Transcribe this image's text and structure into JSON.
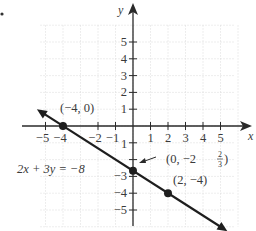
{
  "bullet": "•",
  "chart_data": {
    "type": "line",
    "title": "",
    "equation": "2x + 3y = −8",
    "xlabel": "x",
    "ylabel": "y",
    "xlim": [
      -5.5,
      5.8
    ],
    "ylim": [
      -6,
      6.5
    ],
    "grid": true,
    "x_ticks": [
      -5,
      -4,
      -2,
      -1,
      1,
      2,
      3,
      4,
      5
    ],
    "x_tick_labels": [
      "−5",
      "−4",
      "−2",
      "−1",
      "1",
      "2",
      "3",
      "4",
      "5"
    ],
    "y_ticks": [
      5,
      4,
      3,
      2,
      1,
      -3,
      -4,
      -5
    ],
    "y_tick_labels": [
      "5",
      "4",
      "3",
      "2",
      "1",
      "−3",
      "−4",
      "−5"
    ],
    "line": {
      "slope": -0.6667,
      "intercept": -2.6667,
      "x_range": [
        -5.3,
        5.2
      ]
    },
    "points": [
      {
        "x": -4,
        "y": 0,
        "label": "(−4, 0)"
      },
      {
        "x": 0,
        "y": -2.6667,
        "label_prefix": "(0, −2",
        "label_num": "2",
        "label_den": "3",
        "label_suffix": ")"
      },
      {
        "x": 2,
        "y": -4,
        "label": "(2, −4)"
      }
    ]
  }
}
